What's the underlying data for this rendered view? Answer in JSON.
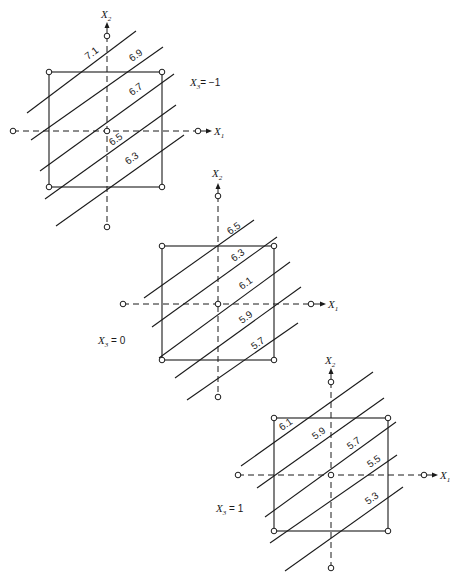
{
  "figure": {
    "panels": [
      {
        "id": "x3-minus-1",
        "level_label": {
          "var": "X",
          "sub": "3",
          "text": "= −1",
          "x": 190,
          "y": 86
        },
        "center": [
          107,
          131
        ],
        "square": {
          "x1": 49,
          "y1": 72,
          "x2": 162,
          "y2": 187
        },
        "axis": {
          "left": 13,
          "right": 198,
          "top": 36,
          "bottom": 227,
          "x_arrow_end": 212,
          "y_arrow_end": 22
        },
        "x1_label": {
          "var": "X",
          "sub": "1",
          "x": 214,
          "y": 135
        },
        "x2_label": {
          "var": "X",
          "sub": "2",
          "x": 101,
          "y": 18
        },
        "contours": [
          {
            "value": "7.1",
            "x1": 27,
            "y1": 113,
            "x2": 136,
            "y2": 31,
            "lx": 88,
            "ly": 60
          },
          {
            "value": "6.9",
            "x1": 31,
            "y1": 140,
            "x2": 163,
            "y2": 47,
            "lx": 132,
            "ly": 62
          },
          {
            "value": "6.7",
            "x1": 40,
            "y1": 171,
            "x2": 174,
            "y2": 74,
            "lx": 132,
            "ly": 96
          },
          {
            "value": "6.5",
            "x1": 45,
            "y1": 199,
            "x2": 176,
            "y2": 105,
            "lx": 112,
            "ly": 146
          },
          {
            "value": "6.3",
            "x1": 56,
            "y1": 226,
            "x2": 184,
            "y2": 135,
            "lx": 128,
            "ly": 165
          }
        ]
      },
      {
        "id": "x3-0",
        "level_label": {
          "var": "X",
          "sub": "3",
          "text": " = 0",
          "x": 98,
          "y": 344
        },
        "center": [
          218,
          304
        ],
        "square": {
          "x1": 162,
          "y1": 246,
          "x2": 274,
          "y2": 360
        },
        "axis": {
          "left": 123,
          "right": 311,
          "top": 196,
          "bottom": 397,
          "x_arrow_end": 326,
          "y_arrow_end": 183
        },
        "x1_label": {
          "var": "X",
          "sub": "1",
          "x": 328,
          "y": 308
        },
        "x2_label": {
          "var": "X",
          "sub": "2",
          "x": 212,
          "y": 177
        },
        "contours": [
          {
            "value": "6.5",
            "x1": 144,
            "y1": 298,
            "x2": 254,
            "y2": 220,
            "lx": 230,
            "ly": 235
          },
          {
            "value": "6.3",
            "x1": 152,
            "y1": 327,
            "x2": 277,
            "y2": 237,
            "lx": 234,
            "ly": 262
          },
          {
            "value": "6.1",
            "x1": 159,
            "y1": 358,
            "x2": 290,
            "y2": 262,
            "lx": 242,
            "ly": 290
          },
          {
            "value": "5.9",
            "x1": 175,
            "y1": 378,
            "x2": 301,
            "y2": 287,
            "lx": 242,
            "ly": 324
          },
          {
            "value": "5.7",
            "x1": 187,
            "y1": 400,
            "x2": 298,
            "y2": 323,
            "lx": 254,
            "ly": 350
          }
        ]
      },
      {
        "id": "x3-plus-1",
        "level_label": {
          "var": "X",
          "sub": "3",
          "text": " = 1",
          "x": 216,
          "y": 512
        },
        "center": [
          331,
          475
        ],
        "square": {
          "x1": 274,
          "y1": 418,
          "x2": 388,
          "y2": 531
        },
        "axis": {
          "left": 238,
          "right": 424,
          "top": 382,
          "bottom": 568,
          "x_arrow_end": 438,
          "y_arrow_end": 368
        },
        "x1_label": {
          "var": "X",
          "sub": "1",
          "x": 440,
          "y": 479
        },
        "x2_label": {
          "var": "X",
          "sub": "2",
          "x": 325,
          "y": 364
        },
        "contours": [
          {
            "value": "6.1",
            "x1": 241,
            "y1": 466,
            "x2": 373,
            "y2": 372,
            "lx": 282,
            "ly": 431
          },
          {
            "value": "5.9",
            "x1": 257,
            "y1": 488,
            "x2": 384,
            "y2": 398,
            "lx": 315,
            "ly": 440
          },
          {
            "value": "5.7",
            "x1": 265,
            "y1": 517,
            "x2": 396,
            "y2": 422,
            "lx": 350,
            "ly": 450
          },
          {
            "value": "5.5",
            "x1": 270,
            "y1": 543,
            "x2": 397,
            "y2": 455,
            "lx": 370,
            "ly": 468
          },
          {
            "value": "5.3",
            "x1": 285,
            "y1": 571,
            "x2": 403,
            "y2": 487,
            "lx": 368,
            "ly": 505
          }
        ]
      }
    ]
  }
}
